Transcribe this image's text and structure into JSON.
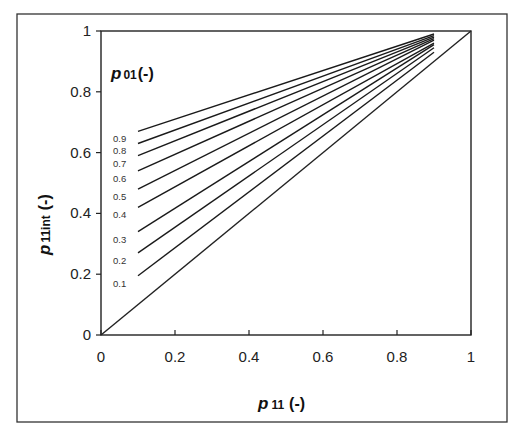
{
  "chart_data": {
    "type": "line",
    "title": "",
    "xlabel": "p 11 (-)",
    "ylabel": "p 11int (-)",
    "xlim": [
      0,
      1
    ],
    "ylim": [
      0,
      1
    ],
    "xticks": [
      "0",
      "0.2",
      "0.4",
      "0.6",
      "0.8",
      "1"
    ],
    "yticks": [
      "0",
      "0.2",
      "0.4",
      "0.6",
      "0.8",
      "1"
    ],
    "grid": false,
    "legend": {
      "title": "p 01(-)",
      "position": "inline-left"
    },
    "x": [
      0.1,
      0.9
    ],
    "series": [
      {
        "name": "0.9",
        "values": [
          0.67,
          0.99
        ]
      },
      {
        "name": "0.8",
        "values": [
          0.63,
          0.985
        ]
      },
      {
        "name": "0.7",
        "values": [
          0.59,
          0.98
        ]
      },
      {
        "name": "0.6",
        "values": [
          0.54,
          0.975
        ]
      },
      {
        "name": "0.5",
        "values": [
          0.48,
          0.97
        ]
      },
      {
        "name": "0.4",
        "values": [
          0.42,
          0.96
        ]
      },
      {
        "name": "0.3",
        "values": [
          0.34,
          0.955
        ]
      },
      {
        "name": "0.2",
        "values": [
          0.27,
          0.945
        ]
      },
      {
        "name": "0.1",
        "values": [
          0.195,
          0.93
        ]
      }
    ],
    "reference_line": {
      "name": "y = x",
      "x": [
        0,
        1
      ],
      "values": [
        0,
        1
      ]
    }
  },
  "labels": {
    "xlabel_main": "p",
    "xlabel_sub": "11",
    "xlabel_unit": "(-)",
    "ylabel_main": "p",
    "ylabel_sub": "11int",
    "ylabel_unit": "(-)",
    "legend_main": "p",
    "legend_sub": "01",
    "legend_unit": "(-)"
  }
}
